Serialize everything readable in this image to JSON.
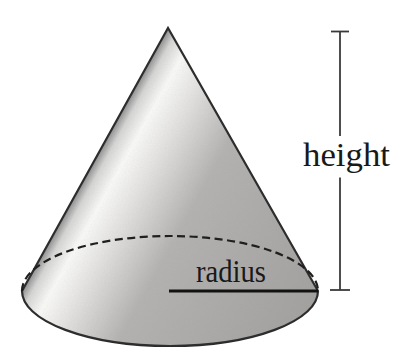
{
  "figure": {
    "labels": {
      "height": "height",
      "radius": "radius"
    }
  },
  "colors": {
    "background": "#ffffff",
    "outline": "#2b2b2b",
    "dashed_edge": "#1f1f1f",
    "radius_line": "#121212",
    "dimension_line": "#3a3a3a",
    "label_text": "#191919",
    "cone_edge_shadow": "#8f8f8f",
    "cone_highlight_rim": "#d6d6d5",
    "cone_highlight": "#fbfbfa",
    "cone_highlight_fade": "#e6e5e3",
    "cone_body": "#b4b3b1",
    "cone_body_dark": "#a3a2a0"
  }
}
